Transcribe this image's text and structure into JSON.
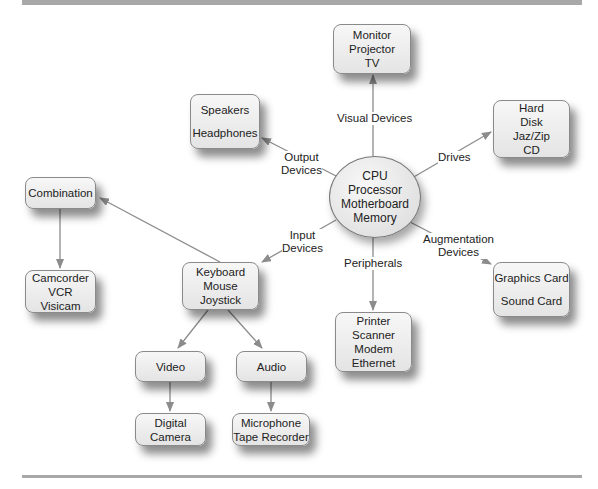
{
  "hub": {
    "lines": [
      "CPU",
      "Processor",
      "Motherboard",
      "Memory"
    ]
  },
  "nodes": {
    "visual": [
      "Monitor",
      "Projector",
      "TV"
    ],
    "output": [
      "Speakers",
      "Headphones"
    ],
    "drives": [
      "Hard",
      "Disk",
      "Jaz/Zip",
      "CD"
    ],
    "augmentation": [
      "Graphics Card",
      "Sound Card"
    ],
    "peripherals": [
      "Printer",
      "Scanner",
      "Modem",
      "Ethernet"
    ],
    "input": [
      "Keyboard",
      "Mouse",
      "Joystick"
    ],
    "combination": [
      "Combination"
    ],
    "camcorder": [
      "Camcorder",
      "VCR",
      "Visicam"
    ],
    "video": [
      "Video"
    ],
    "audio": [
      "Audio"
    ],
    "digital_camera": [
      "Digital",
      "Camera"
    ],
    "microphone": [
      "Microphone",
      "Tape Recorder"
    ]
  },
  "edge_labels": {
    "visual": [
      "Visual Devices"
    ],
    "output": [
      "Output",
      "Devices"
    ],
    "drives": [
      "Drives"
    ],
    "augmentation": [
      "Augmentation",
      "Devices"
    ],
    "peripherals": [
      "Peripherals"
    ],
    "input": [
      "Input",
      "Devices"
    ]
  },
  "colors": {
    "edge": "#8c8c8c",
    "node_border": "#8a8a8a",
    "rule": "#a8a8a8"
  }
}
